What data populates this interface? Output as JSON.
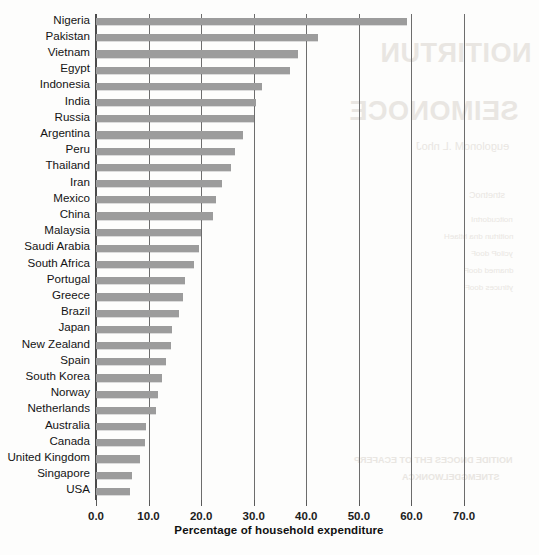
{
  "chart_data": {
    "type": "bar",
    "orientation": "horizontal",
    "title": "",
    "subtitle": "",
    "xlabel": "Percentage of household expenditure",
    "ylabel": "",
    "xlim": [
      0.0,
      70.0
    ],
    "xticks": [
      "0.0",
      "10.0",
      "20.0",
      "30.0",
      "40.0",
      "50.0",
      "60.0",
      "70.0"
    ],
    "xtick_values": [
      0,
      10,
      20,
      30,
      40,
      50,
      60,
      70
    ],
    "grid": "vertical gridlines at each x tick",
    "legend": "none",
    "bar_color": "#9c9c9c",
    "axis_color": "#4b4b4b",
    "categories": [
      "Nigeria",
      "Pakistan",
      "Vietnam",
      "Egypt",
      "Indonesia",
      "India",
      "Russia",
      "Argentina",
      "Peru",
      "Thailand",
      "Iran",
      "Mexico",
      "China",
      "Malaysia",
      "Saudi Arabia",
      "South Africa",
      "Portugal",
      "Greece",
      "Brazil",
      "Japan",
      "New Zealand",
      "Spain",
      "South Korea",
      "Norway",
      "Netherlands",
      "Australia",
      "Canada",
      "United Kingdom",
      "Singapore",
      "USA"
    ],
    "values": [
      59.2,
      42.3,
      38.5,
      36.9,
      31.6,
      30.4,
      30.0,
      28.0,
      26.4,
      25.7,
      23.9,
      22.9,
      22.2,
      20.0,
      19.6,
      18.7,
      17.0,
      16.6,
      15.7,
      14.4,
      14.2,
      13.3,
      12.5,
      11.8,
      11.4,
      9.6,
      9.3,
      8.4,
      6.9,
      6.4
    ],
    "value_unit": "%"
  },
  "background_bleed": {
    "title_line1": "NOITIRTUN",
    "title_line2": "SEIMONOCE",
    "subtitle": "eugolonoM .L nhoJ",
    "small_heading": "stnetnoC",
    "small_1": "noitcudortnI",
    "small_2": "noitirtun dna htlaeH",
    "small_3": "yciloP dooF",
    "small_4": "dnamed dooF",
    "small_5": "ytiruces dooF",
    "small_6": "secirp dooF",
    "foot_line1": "NOITIDE DNOCES EHT OT ECAFERP",
    "foot_line2": "STNEMGDELWONKCA"
  }
}
